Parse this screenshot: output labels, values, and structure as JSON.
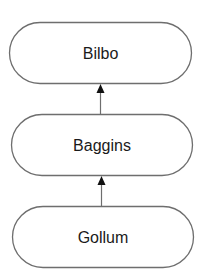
{
  "diagram": {
    "type": "hierarchy",
    "direction": "bottom-to-top",
    "nodes": [
      {
        "id": "bilbo",
        "label": "Bilbo"
      },
      {
        "id": "baggins",
        "label": "Baggins"
      },
      {
        "id": "gollum",
        "label": "Gollum"
      }
    ],
    "edges": [
      {
        "from": "baggins",
        "to": "bilbo"
      },
      {
        "from": "gollum",
        "to": "baggins"
      }
    ]
  }
}
